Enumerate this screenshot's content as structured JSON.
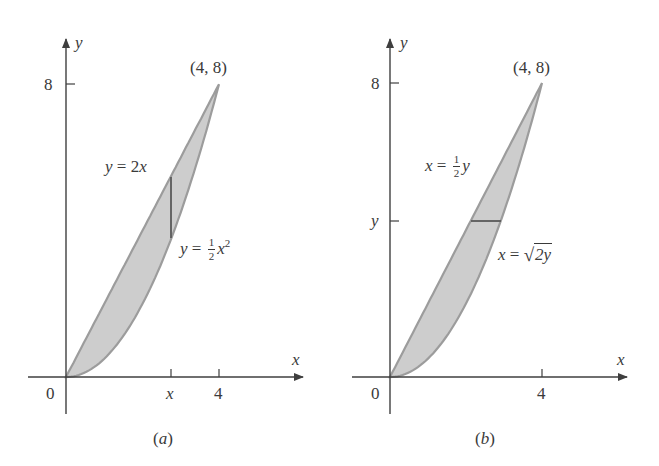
{
  "colors": {
    "axis": "#3f3f3f",
    "region_fill": "#cdcdcd",
    "boundary_stroke": "#9c9c9c",
    "strip": "#5a5a5a",
    "text": "#3a3a3a",
    "background": "#ffffff"
  },
  "panels": [
    {
      "id": "a",
      "caption": "(a)",
      "caption_letter": "a",
      "axis_labels": {
        "x": "x",
        "y": "y"
      },
      "origin_label": "0",
      "x_ticks": [
        {
          "label": "x",
          "value": 2.745
        },
        {
          "label": "4",
          "value": 4
        }
      ],
      "y_ticks": [
        {
          "label": "8",
          "value": 8
        }
      ],
      "point_label": "(4, 8)",
      "curves": [
        {
          "role": "upper",
          "equation_lhs": "y",
          "equation_rhs": "2x",
          "rhs_var": "x",
          "rhs_coef": "2"
        },
        {
          "role": "lower",
          "equation_lhs": "y",
          "equation_rhs": "½x²",
          "frac_num": "1",
          "frac_den": "2",
          "var": "x",
          "exp": "2"
        }
      ],
      "strip": {
        "orientation": "vertical",
        "at": "x"
      }
    },
    {
      "id": "b",
      "caption": "(b)",
      "caption_letter": "b",
      "axis_labels": {
        "x": "x",
        "y": "y"
      },
      "origin_label": "0",
      "x_ticks": [
        {
          "label": "4",
          "value": 4
        }
      ],
      "y_ticks": [
        {
          "label": "8",
          "value": 8
        },
        {
          "label": "y",
          "value": 4.26
        }
      ],
      "point_label": "(4, 8)",
      "curves": [
        {
          "role": "left",
          "equation_lhs": "x",
          "equation_rhs": "½y",
          "frac_num": "1",
          "frac_den": "2",
          "var": "y"
        },
        {
          "role": "right",
          "equation_lhs": "x",
          "equation_rhs": "√(2y)",
          "radicand": "2y"
        }
      ],
      "strip": {
        "orientation": "horizontal",
        "at": "y"
      }
    }
  ],
  "equals": "="
}
